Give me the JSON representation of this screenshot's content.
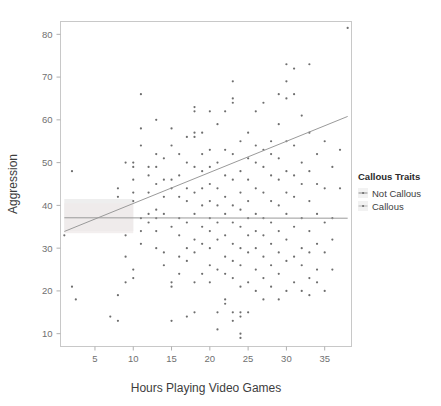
{
  "figure": {
    "background_color": "#ffffff",
    "panel_border_color": "#c8c8c8",
    "point_color": "#6e6e6e",
    "line_color": "#8c8c8c"
  },
  "axes": {
    "x_title": "Hours Playing Video Games",
    "y_title": "Aggression",
    "x_ticks": [
      "5",
      "10",
      "15",
      "20",
      "25",
      "30",
      "35"
    ],
    "y_ticks": [
      "10",
      "20",
      "30",
      "40",
      "50",
      "60",
      "70",
      "80"
    ]
  },
  "legend": {
    "title": "Callous Traits",
    "items": [
      {
        "label": "Not Callous",
        "color": "#8c8c8c",
        "key_icon": "point-line-key-icon"
      },
      {
        "label": "Callous",
        "color": "#b5b5b5",
        "key_icon": "point-line-key-icon"
      }
    ]
  },
  "chart_data": {
    "type": "scatter",
    "title": "",
    "xlabel": "Hours Playing Video Games",
    "ylabel": "Aggression",
    "xlim": [
      0.5,
      38.5
    ],
    "ylim": [
      7,
      83
    ],
    "xticks": [
      5,
      10,
      15,
      20,
      25,
      30,
      35
    ],
    "yticks": [
      10,
      20,
      30,
      40,
      50,
      60,
      70,
      80
    ],
    "grid": false,
    "legend_position": "right",
    "legend_title": "Callous Traits",
    "series": [
      {
        "name": "Not Callous",
        "color": "#6e6e6e",
        "fit": {
          "type": "linear",
          "x_start": 1,
          "y_start": 33.9,
          "x_end": 38,
          "y_end": 60.8,
          "slope": 0.727,
          "intercept": 33.17,
          "band": {
            "x_start": 1,
            "x_end": 10,
            "y_upper": 41.5,
            "y_lower": 34.0
          }
        },
        "points": [
          [
            1,
            33
          ],
          [
            2,
            21
          ],
          [
            2.5,
            18
          ],
          [
            2,
            48
          ],
          [
            7,
            14
          ],
          [
            8,
            13
          ],
          [
            8,
            19
          ],
          [
            8,
            44
          ],
          [
            8,
            42
          ],
          [
            9,
            22
          ],
          [
            9,
            28
          ],
          [
            9,
            50
          ],
          [
            9,
            33
          ],
          [
            10,
            23
          ],
          [
            10,
            25
          ],
          [
            10,
            41
          ],
          [
            10,
            43
          ],
          [
            10,
            46
          ],
          [
            10,
            50
          ],
          [
            10,
            49
          ],
          [
            11,
            31
          ],
          [
            11,
            34
          ],
          [
            11,
            54
          ],
          [
            11,
            58
          ],
          [
            11,
            66
          ],
          [
            11,
            37
          ],
          [
            12,
            36
          ],
          [
            12,
            38
          ],
          [
            12,
            43
          ],
          [
            12,
            47
          ],
          [
            12,
            49
          ],
          [
            13,
            30
          ],
          [
            13,
            34
          ],
          [
            13,
            37
          ],
          [
            13,
            39
          ],
          [
            13,
            49
          ],
          [
            13,
            52
          ],
          [
            13,
            60
          ],
          [
            13,
            45
          ],
          [
            14,
            26
          ],
          [
            14,
            29
          ],
          [
            14,
            38
          ],
          [
            14,
            42
          ],
          [
            14,
            46
          ],
          [
            14,
            51
          ],
          [
            15,
            13
          ],
          [
            15,
            21
          ],
          [
            15,
            22
          ],
          [
            15,
            35
          ],
          [
            15,
            44
          ],
          [
            15,
            46
          ],
          [
            15,
            54
          ],
          [
            15,
            58
          ],
          [
            16,
            24
          ],
          [
            16,
            28
          ],
          [
            16,
            33
          ],
          [
            16,
            37
          ],
          [
            16,
            42
          ],
          [
            16,
            47
          ],
          [
            16,
            52
          ],
          [
            17,
            14
          ],
          [
            17,
            27
          ],
          [
            17,
            30
          ],
          [
            17,
            36
          ],
          [
            17,
            41
          ],
          [
            17,
            44
          ],
          [
            17,
            50
          ],
          [
            17,
            56
          ],
          [
            18,
            15
          ],
          [
            18,
            22
          ],
          [
            18,
            29
          ],
          [
            18,
            32
          ],
          [
            18,
            38
          ],
          [
            18,
            43
          ],
          [
            18,
            49
          ],
          [
            18,
            56
          ],
          [
            18,
            57
          ],
          [
            18,
            62
          ],
          [
            18,
            63
          ],
          [
            19,
            24
          ],
          [
            19,
            31
          ],
          [
            19,
            35
          ],
          [
            19,
            40
          ],
          [
            19,
            44
          ],
          [
            19,
            48
          ],
          [
            19,
            52
          ],
          [
            19,
            57
          ],
          [
            20,
            22
          ],
          [
            20,
            26
          ],
          [
            20,
            30
          ],
          [
            20,
            34
          ],
          [
            20,
            37
          ],
          [
            20,
            41
          ],
          [
            20,
            45
          ],
          [
            20,
            49
          ],
          [
            20,
            53
          ],
          [
            20,
            62
          ],
          [
            21,
            11
          ],
          [
            21,
            15
          ],
          [
            21,
            25
          ],
          [
            21,
            32
          ],
          [
            21,
            36
          ],
          [
            21,
            40
          ],
          [
            21,
            44
          ],
          [
            21,
            50
          ],
          [
            21,
            59
          ],
          [
            22,
            17
          ],
          [
            22,
            18
          ],
          [
            22,
            24
          ],
          [
            22,
            28
          ],
          [
            22,
            33
          ],
          [
            22,
            38
          ],
          [
            22,
            42
          ],
          [
            22,
            47
          ],
          [
            22,
            53
          ],
          [
            22,
            62
          ],
          [
            23,
            13
          ],
          [
            23,
            15
          ],
          [
            23,
            23
          ],
          [
            23,
            27
          ],
          [
            23,
            31
          ],
          [
            23,
            36
          ],
          [
            23,
            40
          ],
          [
            23,
            46
          ],
          [
            23,
            52
          ],
          [
            23,
            64
          ],
          [
            23,
            65
          ],
          [
            23,
            69
          ],
          [
            24,
            9
          ],
          [
            24,
            10
          ],
          [
            24,
            14
          ],
          [
            24,
            15
          ],
          [
            24,
            21
          ],
          [
            24,
            26
          ],
          [
            24,
            30
          ],
          [
            24,
            35
          ],
          [
            24,
            39
          ],
          [
            24,
            43
          ],
          [
            24,
            48
          ],
          [
            24,
            55
          ],
          [
            25,
            15
          ],
          [
            25,
            22
          ],
          [
            25,
            29
          ],
          [
            25,
            33
          ],
          [
            25,
            37
          ],
          [
            25,
            41
          ],
          [
            25,
            46
          ],
          [
            25,
            51
          ],
          [
            25,
            57
          ],
          [
            26,
            20
          ],
          [
            26,
            25
          ],
          [
            26,
            30
          ],
          [
            26,
            34
          ],
          [
            26,
            38
          ],
          [
            26,
            44
          ],
          [
            26,
            50
          ],
          [
            26,
            54
          ],
          [
            26,
            62
          ],
          [
            27,
            18
          ],
          [
            27,
            23
          ],
          [
            27,
            28
          ],
          [
            27,
            33
          ],
          [
            27,
            37
          ],
          [
            27,
            43
          ],
          [
            27,
            49
          ],
          [
            27,
            53
          ],
          [
            27,
            64
          ],
          [
            28,
            21
          ],
          [
            28,
            26
          ],
          [
            28,
            31
          ],
          [
            28,
            36
          ],
          [
            28,
            41
          ],
          [
            28,
            47
          ],
          [
            28,
            52
          ],
          [
            28,
            55
          ],
          [
            29,
            18
          ],
          [
            29,
            24
          ],
          [
            29,
            29
          ],
          [
            29,
            34
          ],
          [
            29,
            40
          ],
          [
            29,
            46
          ],
          [
            29,
            51
          ],
          [
            29,
            59
          ],
          [
            29,
            66
          ],
          [
            30,
            20
          ],
          [
            30,
            27
          ],
          [
            30,
            32
          ],
          [
            30,
            38
          ],
          [
            30,
            43
          ],
          [
            30,
            48
          ],
          [
            30,
            55
          ],
          [
            30,
            65
          ],
          [
            30,
            69
          ],
          [
            30,
            73
          ],
          [
            31,
            22
          ],
          [
            31,
            28
          ],
          [
            31,
            35
          ],
          [
            31,
            42
          ],
          [
            31,
            47
          ],
          [
            31,
            54
          ],
          [
            31,
            66
          ],
          [
            31,
            72
          ],
          [
            32,
            20
          ],
          [
            32,
            26
          ],
          [
            32,
            30
          ],
          [
            32,
            37
          ],
          [
            32,
            45
          ],
          [
            32,
            50
          ],
          [
            32,
            61
          ],
          [
            33,
            19
          ],
          [
            33,
            23
          ],
          [
            33,
            29
          ],
          [
            33,
            34
          ],
          [
            33,
            41
          ],
          [
            33,
            48
          ],
          [
            33,
            57
          ],
          [
            33,
            73
          ],
          [
            34,
            22
          ],
          [
            34,
            25
          ],
          [
            34,
            31
          ],
          [
            34,
            38
          ],
          [
            34,
            45
          ],
          [
            34,
            52
          ],
          [
            35,
            20
          ],
          [
            35,
            29
          ],
          [
            35,
            36
          ],
          [
            35,
            44
          ],
          [
            35,
            55
          ],
          [
            36,
            25
          ],
          [
            36,
            32
          ],
          [
            36,
            37
          ],
          [
            36,
            49
          ],
          [
            37,
            44
          ],
          [
            37,
            53
          ],
          [
            38,
            81.5
          ]
        ]
      },
      {
        "name": "Callous",
        "color": "#b5b5b5",
        "fit": {
          "type": "linear",
          "x_start": 1,
          "y_start": 37.1,
          "x_end": 38,
          "y_end": 37.0,
          "slope": -0.003,
          "intercept": 37.1,
          "band": {
            "x_start": 1,
            "x_end": 10,
            "y_upper": 40.5,
            "y_lower": 33.5
          }
        },
        "points": []
      }
    ]
  }
}
